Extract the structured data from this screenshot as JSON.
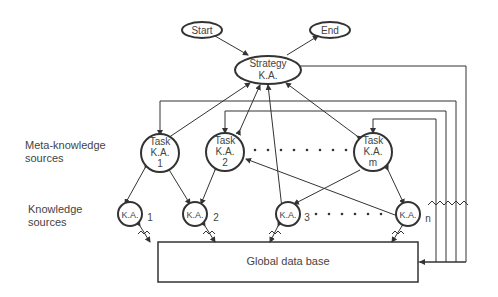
{
  "diagram": {
    "nodes": {
      "start": {
        "label": "Start"
      },
      "end": {
        "label": "End"
      },
      "strategy": {
        "line1": "Strategy",
        "line2": "K.A."
      },
      "task1": {
        "line1": "Task",
        "line2": "K.A.",
        "line3": "1"
      },
      "task2": {
        "line1": "Task",
        "line2": "K.A.",
        "line3": "2"
      },
      "taskm": {
        "line1": "Task",
        "line2": "K.A.",
        "line3": "m"
      },
      "ka1": {
        "label": "K.A.",
        "index": "1"
      },
      "ka2": {
        "label": "K.A.",
        "index": "2"
      },
      "ka3": {
        "label": "K.A.",
        "index": "3"
      },
      "kan": {
        "label": "K.A.",
        "index": "n"
      },
      "global_db": {
        "label": "Global data base"
      }
    },
    "side_labels": {
      "meta_line1": "Meta-knowledge",
      "meta_line2": "sources",
      "ks_line1": "Knowledge",
      "ks_line2": "sources"
    },
    "colors": {
      "stroke": "#333333",
      "text": "#444444",
      "background": "#ffffff"
    }
  }
}
